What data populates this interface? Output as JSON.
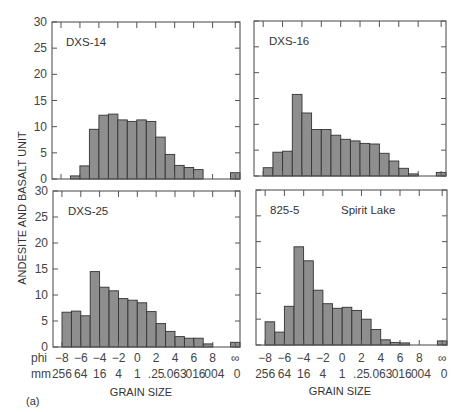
{
  "chart_data": [
    {
      "type": "bar",
      "title": "DXS-14",
      "position": "top-left",
      "x_phi_bins": [
        -8,
        -7,
        -6,
        -5,
        -4,
        -3,
        -2,
        -1,
        0,
        1,
        2,
        3,
        4,
        5,
        6,
        7,
        8,
        "inf"
      ],
      "values": [
        0,
        0.6,
        2.5,
        9.5,
        12.2,
        12.4,
        11.3,
        11.0,
        11.3,
        11.0,
        8.0,
        4.7,
        2.6,
        2.2,
        1.8,
        0,
        0,
        1.2
      ],
      "ylim": [
        0,
        30
      ]
    },
    {
      "type": "bar",
      "title": "DXS-16",
      "position": "top-right",
      "x_phi_bins": [
        -8,
        -7,
        -6,
        -5,
        -4,
        -3,
        -2,
        -1,
        0,
        1,
        2,
        3,
        4,
        5,
        6,
        7,
        8,
        "inf"
      ],
      "values": [
        1.6,
        4.6,
        4.8,
        15.8,
        12.2,
        9.0,
        9.0,
        7.9,
        7.1,
        6.8,
        6.3,
        6.2,
        4.4,
        2.9,
        1.5,
        0.4,
        0,
        0.7
      ],
      "ylim": [
        0,
        30
      ]
    },
    {
      "type": "bar",
      "title": "DXS-25",
      "position": "bottom-left",
      "x_phi_bins": [
        -8,
        -7,
        -6,
        -5,
        -4,
        -3,
        -2,
        -1,
        0,
        1,
        2,
        3,
        4,
        5,
        6,
        7,
        8,
        "inf"
      ],
      "values": [
        6.7,
        6.9,
        6.0,
        14.5,
        11.5,
        10.8,
        9.3,
        9.0,
        8.5,
        6.8,
        4.5,
        3.0,
        2.0,
        1.7,
        1.7,
        0.6,
        0,
        0.9
      ],
      "ylim": [
        0,
        30
      ]
    },
    {
      "type": "bar",
      "title": "825-5 Spirit Lake",
      "position": "bottom-right",
      "x_phi_bins": [
        -8,
        -7,
        -6,
        -5,
        -4,
        -3,
        -2,
        -1,
        0,
        1,
        2,
        3,
        4,
        5,
        6,
        7,
        8,
        "inf"
      ],
      "values": [
        4.5,
        2.5,
        7.5,
        19.0,
        16.3,
        10.6,
        8.0,
        7.1,
        7.3,
        6.7,
        5.0,
        3.0,
        1.0,
        0.5,
        0.4,
        0,
        0,
        0.8
      ],
      "ylim": [
        0,
        30
      ]
    }
  ],
  "figure": {
    "ylabel": "ANDESITE AND BASALT UNIT",
    "xlabel": "GRAIN SIZE",
    "y_ticks": [
      "0",
      "5",
      "10",
      "15",
      "20",
      "25",
      "30"
    ],
    "phi_row_label": "phi",
    "mm_row_label": "mm",
    "phi_ticks": [
      "−8",
      "−6",
      "−4",
      "−2",
      "0",
      "2",
      "4",
      "6",
      "8",
      "∞"
    ],
    "mm_ticks": [
      "256",
      "64",
      "16",
      "4",
      "1",
      ".25",
      ".063",
      ".016",
      ".004",
      "0"
    ],
    "panel_caption": "(a)",
    "panels": {
      "top_left": {
        "label": "DXS-14"
      },
      "top_right": {
        "label": "DXS-16"
      },
      "bottom_left": {
        "label": "DXS-25"
      },
      "bottom_right": {
        "label": "825-5",
        "sublabel": "Spirit Lake"
      }
    },
    "colors": {
      "bar_fill": "#8e8e8e",
      "bar_stroke": "#333333",
      "frame": "#555555"
    }
  }
}
